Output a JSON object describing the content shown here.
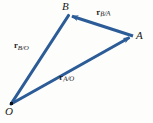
{
  "figure": {
    "background_color": "#fdfdfc",
    "vector_color": "#2c5c97",
    "label_color": "#1a1a1a",
    "width": 153,
    "height": 123
  },
  "points": [
    {
      "id": "O",
      "label": "O",
      "x": 11,
      "y": 104,
      "label_x": 5,
      "label_y": 106,
      "has_dot": true
    },
    {
      "id": "A",
      "label": "A",
      "x": 133,
      "y": 36,
      "label_x": 136,
      "label_y": 30,
      "has_dot": false
    },
    {
      "id": "B",
      "label": "B",
      "x": 68,
      "y": 15,
      "label_x": 62,
      "label_y": 1,
      "has_dot": false
    }
  ],
  "vectors": [
    {
      "id": "r_B_over_O",
      "symbol": "r",
      "subscript": "B/O",
      "from": "O",
      "to": "B",
      "x1": 11,
      "y1": 104,
      "x2": 68,
      "y2": 15,
      "label_x": 14,
      "label_y": 41,
      "arrow_at_tip": false
    },
    {
      "id": "r_A_over_O",
      "symbol": "r",
      "subscript": "A/O",
      "from": "O",
      "to": "A",
      "x1": 11,
      "y1": 104,
      "x2": 133,
      "y2": 36,
      "label_x": 59,
      "label_y": 73,
      "arrow_at_tip": true
    },
    {
      "id": "r_B_over_A",
      "symbol": "r",
      "subscript": "B/A",
      "from": "A",
      "to": "B",
      "x1": 133,
      "y1": 36,
      "x2": 68,
      "y2": 15,
      "label_x": 96,
      "label_y": 8,
      "arrow_at_tip": true
    }
  ]
}
